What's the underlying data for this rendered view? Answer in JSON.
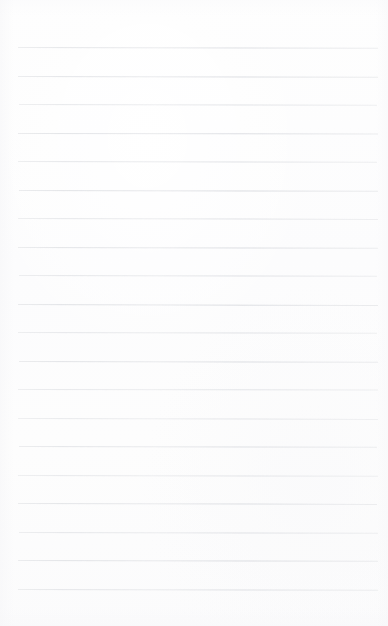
{
  "document": {
    "kind": "lined-notebook-paper",
    "title": "Blank lined paper sheet",
    "content_text": "",
    "width_px": 388,
    "height_px": 626
  },
  "colors": {
    "paper_background": "#fdfdfd",
    "rule_line": "#e9eaec",
    "rule_line_accent": "#dddfe3",
    "page_edge_shade": "#f6f6f8"
  },
  "ruling": {
    "line_count": 20,
    "first_line_y": 47,
    "line_spacing_px": 28.5,
    "line_thickness_px": 1,
    "left_margin_px": 18,
    "right_margin_px": 10,
    "top_blank_px": 47,
    "bottom_blank_px": 37,
    "has_vertical_margin_rule": false,
    "has_holes": false
  },
  "lines": [
    {
      "index": 1,
      "y": 47.0,
      "left": 18,
      "width": 360,
      "tilt_deg": 0.12,
      "opacity": 0.78
    },
    {
      "index": 2,
      "y": 75.5,
      "left": 18,
      "width": 360,
      "tilt_deg": 0.1,
      "opacity": 0.82
    },
    {
      "index": 3,
      "y": 104.0,
      "left": 19,
      "width": 358,
      "tilt_deg": 0.14,
      "opacity": 0.7
    },
    {
      "index": 4,
      "y": 132.5,
      "left": 18,
      "width": 360,
      "tilt_deg": 0.09,
      "opacity": 0.86
    },
    {
      "index": 5,
      "y": 161.0,
      "left": 18,
      "width": 359,
      "tilt_deg": 0.13,
      "opacity": 0.74
    },
    {
      "index": 6,
      "y": 189.5,
      "left": 19,
      "width": 359,
      "tilt_deg": 0.11,
      "opacity": 0.88
    },
    {
      "index": 7,
      "y": 218.0,
      "left": 18,
      "width": 360,
      "tilt_deg": 0.15,
      "opacity": 0.72
    },
    {
      "index": 8,
      "y": 246.5,
      "left": 18,
      "width": 360,
      "tilt_deg": 0.1,
      "opacity": 0.84
    },
    {
      "index": 9,
      "y": 275.0,
      "left": 19,
      "width": 358,
      "tilt_deg": 0.12,
      "opacity": 0.76
    },
    {
      "index": 10,
      "y": 303.5,
      "left": 18,
      "width": 360,
      "tilt_deg": 0.16,
      "opacity": 0.9
    },
    {
      "index": 11,
      "y": 332.0,
      "left": 18,
      "width": 359,
      "tilt_deg": 0.11,
      "opacity": 0.73
    },
    {
      "index": 12,
      "y": 360.5,
      "left": 19,
      "width": 359,
      "tilt_deg": 0.13,
      "opacity": 0.85
    },
    {
      "index": 13,
      "y": 389.0,
      "left": 18,
      "width": 360,
      "tilt_deg": 0.09,
      "opacity": 0.71
    },
    {
      "index": 14,
      "y": 417.5,
      "left": 18,
      "width": 360,
      "tilt_deg": 0.14,
      "opacity": 0.66
    },
    {
      "index": 15,
      "y": 446.0,
      "left": 19,
      "width": 358,
      "tilt_deg": 0.12,
      "opacity": 0.8
    },
    {
      "index": 16,
      "y": 474.5,
      "left": 18,
      "width": 360,
      "tilt_deg": 0.1,
      "opacity": 0.68
    },
    {
      "index": 17,
      "y": 503.0,
      "left": 18,
      "width": 359,
      "tilt_deg": 0.15,
      "opacity": 0.83
    },
    {
      "index": 18,
      "y": 531.5,
      "left": 19,
      "width": 359,
      "tilt_deg": 0.11,
      "opacity": 0.75
    },
    {
      "index": 19,
      "y": 560.0,
      "left": 18,
      "width": 360,
      "tilt_deg": 0.13,
      "opacity": 0.87
    },
    {
      "index": 20,
      "y": 588.5,
      "left": 18,
      "width": 360,
      "tilt_deg": 0.1,
      "opacity": 0.79
    }
  ]
}
